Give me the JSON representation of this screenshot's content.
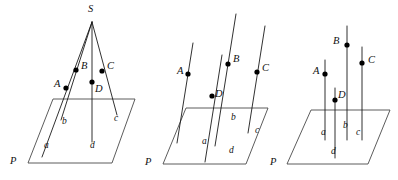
{
  "figure": {
    "background_color": "#ffffff",
    "line_color": "#1a1a1a",
    "plane_color": "#4a4a4a",
    "point_color": "#000000",
    "panels": [
      {
        "id": "panel-concurrent",
        "caption": "lines concurrent at S",
        "plane_label": "P",
        "apex_label": "S",
        "point_labels": [
          "A",
          "B",
          "C",
          "D"
        ],
        "line_labels": [
          "a",
          "b",
          "c",
          "d"
        ]
      },
      {
        "id": "panel-parallel-oblique",
        "caption": "parallel oblique lines",
        "plane_label": "P",
        "point_labels": [
          "A",
          "B",
          "C",
          "D"
        ],
        "line_labels": [
          "a",
          "b",
          "c",
          "d"
        ]
      },
      {
        "id": "panel-parallel-vertical",
        "caption": "parallel vertical lines",
        "plane_label": "P",
        "point_labels": [
          "A",
          "B",
          "C",
          "D"
        ],
        "line_labels": [
          "a",
          "b",
          "c",
          "d"
        ]
      }
    ],
    "labels": {
      "p1": {
        "S": "S",
        "A": "A",
        "B": "B",
        "C": "C",
        "D": "D",
        "a": "a",
        "b": "b",
        "c": "c",
        "d": "d",
        "P": "P"
      },
      "p2": {
        "A": "A",
        "B": "B",
        "C": "C",
        "D": "D",
        "a": "a",
        "b": "b",
        "c": "c",
        "d": "d",
        "P": "P"
      },
      "p3": {
        "A": "A",
        "B": "B",
        "C": "C",
        "D": "D",
        "a": "a",
        "b": "b",
        "c": "c",
        "d": "d",
        "P": "P"
      }
    }
  }
}
